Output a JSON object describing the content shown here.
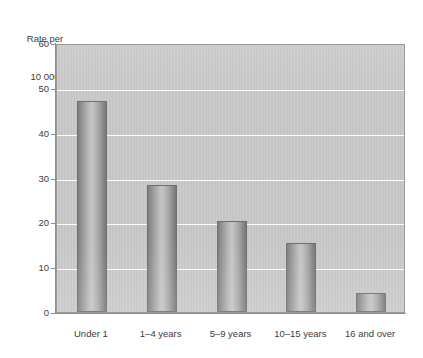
{
  "chart_data": {
    "type": "bar",
    "title": "",
    "subtitle": "",
    "xlabel": "",
    "ylabel": "Rate per 10 000",
    "ylabel_lines": [
      "Rate per",
      "10 000"
    ],
    "categories": [
      "Under 1",
      "1–4  years",
      "5–9  years",
      "10–15  years",
      "16 and over"
    ],
    "values": [
      47.0,
      28.3,
      20.3,
      15.4,
      4.2
    ],
    "ylim": [
      0,
      60
    ],
    "ytick_values": [
      0,
      10,
      20,
      30,
      40,
      50,
      60
    ],
    "ytick_labels": [
      "0",
      "10",
      "20",
      "30",
      "40",
      "50",
      "60"
    ],
    "grid": true,
    "grid_axis": "y",
    "grid_color": "#fdfdfd",
    "legend": false,
    "legend_position": "none",
    "plot_background": "#c9c9c9",
    "bar_fill_light": "#c6c6c6",
    "bar_fill_dark": "#787878",
    "bar_edge_color": "#6f6f6f",
    "axis_color": "#8e8e8e",
    "text_color": "#3c3c3c"
  }
}
